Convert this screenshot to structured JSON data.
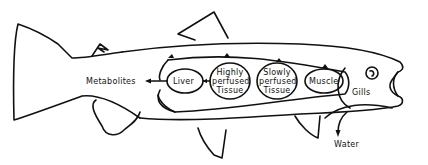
{
  "diagram": {
    "compartments": [
      {
        "id": "liver",
        "label": "Liver"
      },
      {
        "id": "highly",
        "label_lines": [
          "Highly",
          "perfused",
          "Tissue"
        ]
      },
      {
        "id": "slowly",
        "label_lines": [
          "Slowly",
          "perfused",
          "Tissue"
        ]
      },
      {
        "id": "muscle",
        "label": "Muscle"
      }
    ],
    "labels": {
      "metabolites": "Metabolites",
      "gills": "Gills",
      "water": "Water"
    },
    "colors": {
      "stroke": "#111111",
      "background": "#ffffff"
    }
  }
}
